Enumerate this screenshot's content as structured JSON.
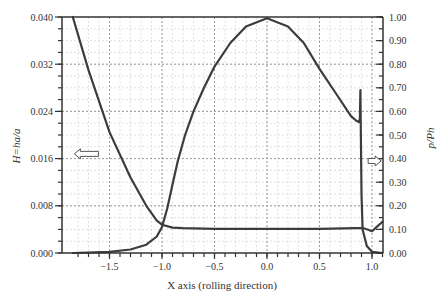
{
  "chart_data": {
    "type": "line",
    "title": "",
    "xlabel": "X axis (rolling direction)",
    "ylabel_left": "H=ha/a",
    "ylabel_right": "p/Ph",
    "xlim": [
      -1.85,
      1.1
    ],
    "ylim_left": [
      0.0,
      0.04
    ],
    "ylim_right": [
      0.0,
      1.0
    ],
    "grid": true,
    "x_ticks": [
      -1.5,
      -1.0,
      -0.5,
      0.0,
      0.5,
      1.0
    ],
    "x_tick_labels": [
      "−1.5",
      "−1.0",
      "−0.5",
      "0.0",
      "0.5",
      "1.0"
    ],
    "y_left_ticks": [
      0.0,
      0.008,
      0.016,
      0.024,
      0.032,
      0.04
    ],
    "y_left_tick_labels": [
      "0.000",
      "0.008",
      "0.016",
      "0.024",
      "0.032",
      "0.040"
    ],
    "y_right_ticks": [
      0.0,
      0.1,
      0.2,
      0.3,
      0.4,
      0.5,
      0.6,
      0.7,
      0.8,
      0.9,
      1.0
    ],
    "y_right_tick_labels": [
      "0.00",
      "0.10",
      "0.20",
      "0.30",
      "0.40",
      "0.50",
      "0.60",
      "0.70",
      "0.80",
      "0.90",
      "1.00"
    ],
    "annotations": [
      {
        "type": "arrow",
        "direction": "left",
        "meaning": "H curve uses left axis",
        "x": -1.72,
        "y_right": 0.42
      },
      {
        "type": "arrow",
        "direction": "right",
        "meaning": "p/Ph curve uses right axis",
        "x": 1.03,
        "y_right": 0.39
      }
    ],
    "series": [
      {
        "name": "H=ha/a (film thickness)",
        "axis": "left",
        "x": [
          -1.85,
          -1.7,
          -1.5,
          -1.3,
          -1.15,
          -1.05,
          -1.0,
          -0.9,
          -0.8,
          -0.5,
          0.0,
          0.5,
          0.85,
          0.92,
          0.97,
          1.0,
          1.05,
          1.1
        ],
        "y": [
          0.04,
          0.031,
          0.0205,
          0.0128,
          0.008,
          0.0055,
          0.0048,
          0.0043,
          0.0042,
          0.0041,
          0.0041,
          0.0041,
          0.0042,
          0.0042,
          0.0039,
          0.0037,
          0.0045,
          0.0053
        ]
      },
      {
        "name": "p/Ph (pressure)",
        "axis": "right",
        "x": [
          -1.85,
          -1.5,
          -1.3,
          -1.15,
          -1.05,
          -1.0,
          -0.95,
          -0.9,
          -0.85,
          -0.78,
          -0.7,
          -0.6,
          -0.5,
          -0.35,
          -0.2,
          0.0,
          0.2,
          0.35,
          0.5,
          0.65,
          0.8,
          0.85,
          0.875,
          0.885,
          0.89,
          0.895,
          0.9,
          0.91,
          0.95,
          1.0,
          1.1
        ],
        "y": [
          0.0,
          0.005,
          0.015,
          0.035,
          0.07,
          0.11,
          0.19,
          0.29,
          0.39,
          0.5,
          0.6,
          0.7,
          0.79,
          0.89,
          0.96,
          0.995,
          0.96,
          0.89,
          0.78,
          0.68,
          0.58,
          0.56,
          0.555,
          0.57,
          0.69,
          0.45,
          0.25,
          0.1,
          0.03,
          0.005,
          0.0
        ]
      }
    ]
  }
}
